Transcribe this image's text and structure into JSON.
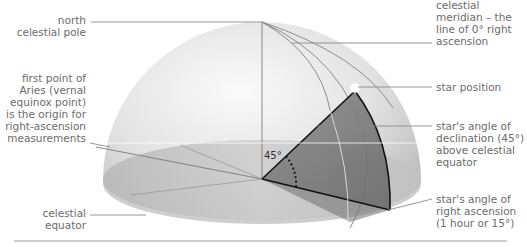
{
  "diagram": {
    "type": "celestial-sphere-coordinates",
    "angle_marker": "45°",
    "colors": {
      "dome_light": "#f3f3f3",
      "dome_dark": "#b9b9b9",
      "equator_plane": "#c8c8c8",
      "sector_fill": "#7a7a7a",
      "sector_edge": "#111111",
      "leader_line": "#8a8a8a",
      "label_text": "#6b6b6b",
      "star": "#ffffff"
    }
  },
  "labels": {
    "north_pole": "north\ncelestial pole",
    "first_point_aries": "first point of\nAries (vernal\nequinox point)\nis the origin for\nright-ascension\nmeasurements",
    "celestial_equator": "celestial\nequator",
    "celestial_meridian": "celestial\nmeridian – the\nline of 0° right\nascension",
    "star_position": "star position",
    "declination": "star's angle of\ndeclination (45°)\nabove celestial\nequator",
    "right_ascension": "star's angle of\nright ascension\n(1 hour or 15°)"
  }
}
